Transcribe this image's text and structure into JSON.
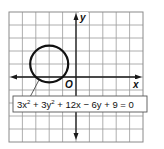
{
  "figure": {
    "type": "coordinate-graph",
    "axes": {
      "x_label": "x",
      "y_label": "y",
      "origin_label": "O"
    },
    "grid": {
      "columns": 10,
      "rows": 10,
      "x_range": [
        -5,
        5
      ],
      "y_range": [
        -5,
        5
      ]
    },
    "circle": {
      "center": [
        -2,
        1
      ],
      "radius_squared": 2
    },
    "equation": {
      "parts": [
        "3x",
        "2",
        " + 3y",
        "2",
        " + 12x − 6y + 9 = 0"
      ],
      "full_text": "3x² + 3y² + 12x − 6y + 9 = 0"
    }
  }
}
